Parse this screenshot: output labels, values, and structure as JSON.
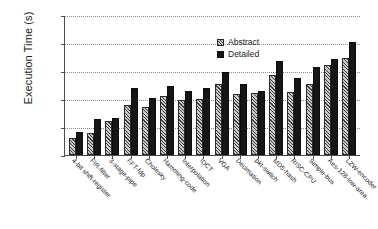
{
  "chart_data": {
    "type": "bar",
    "title": "",
    "xlabel": "",
    "ylabel": "Execution Time (s)",
    "yscale": "log",
    "ylim": [
      1,
      100000
    ],
    "yticks": [
      1,
      10,
      100,
      1000,
      10000,
      100000
    ],
    "ytick_labels": [
      "1",
      "10",
      "100",
      "1000",
      "10000",
      "100000"
    ],
    "grid": true,
    "legend_position": "top-center",
    "categories": [
      "4-bit shift-register",
      "FIR-filter",
      "3-stage-pipe",
      "FFT-fdp",
      "Cholesky",
      "Hamming-code",
      "Interpolation",
      "IDCT",
      "VGA",
      "Decimation",
      "pkt-switch",
      "MD5-hash",
      "RISC-CPU",
      "Simple-bus",
      "Aes-128-low-area",
      "LZW-encoder"
    ],
    "series": [
      {
        "name": "Abstract",
        "color": "#c9c9c9",
        "pattern": "hatched",
        "values": [
          4,
          6,
          17,
          60,
          50,
          125,
          90,
          98,
          350,
          150,
          165,
          700,
          180,
          330,
          1650,
          2950
        ]
      },
      {
        "name": "Detailed",
        "color": "#161616",
        "pattern": "solid",
        "values": [
          6.5,
          19,
          21,
          240,
          105,
          290,
          200,
          240,
          900,
          350,
          200,
          2300,
          550,
          1350,
          2700,
          11000
        ]
      }
    ]
  }
}
